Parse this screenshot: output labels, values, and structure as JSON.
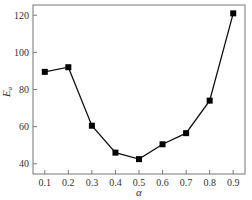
{
  "chart_data": {
    "type": "line",
    "title": "",
    "xlabel": "α",
    "ylabel": "E_a",
    "x": [
      0.1,
      0.2,
      0.3,
      0.4,
      0.5,
      0.6,
      0.7,
      0.8,
      0.9
    ],
    "series": [
      {
        "name": "E_a",
        "values": [
          89.5,
          92,
          60.5,
          46,
          42.5,
          50.5,
          56.5,
          74,
          121
        ],
        "marker": "square",
        "color": "#000000"
      }
    ],
    "xlim": [
      0.05,
      0.95
    ],
    "ylim": [
      34.5,
      125.5
    ],
    "xticks": [
      "0.1",
      "0.2",
      "0.3",
      "0.4",
      "0.5",
      "0.6",
      "0.7",
      "0.8",
      "0.9"
    ],
    "yticks": [
      "40",
      "60",
      "80",
      "100",
      "120"
    ],
    "grid": false,
    "legend": null
  }
}
